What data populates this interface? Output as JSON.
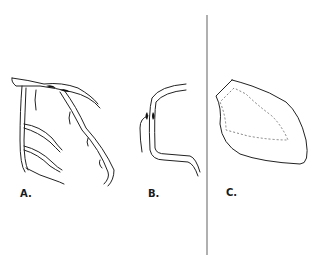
{
  "figure": {
    "panels": [
      {
        "id": "A",
        "label": "A.",
        "description": "coronary artery tree with branches"
      },
      {
        "id": "B",
        "label": "B.",
        "description": "single vessel segment with stenosis"
      },
      {
        "id": "C",
        "label": "C.",
        "description": "ventricle outline with dashed inner contour"
      }
    ],
    "colors": {
      "line": "#222222",
      "divider": "#b0b0b0",
      "background": "#ffffff"
    }
  }
}
